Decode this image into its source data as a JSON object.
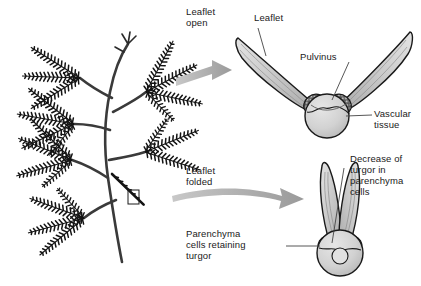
{
  "figure": {
    "background_color": "#ffffff",
    "width": 421,
    "height": 286
  },
  "palette": {
    "outline": "#1a1a1a",
    "leaflet_fill": "#c9c9c9",
    "leaflet_fill_light": "#dcdcdc",
    "pulvinus_fill": "#d2d2d2",
    "pulvinus_core_fill": "#e2e2e2",
    "parenchyma_dark": "#4a4a4a",
    "arrow_gray": "#a8a8a8",
    "plant_black": "#141414",
    "leader_line": "#444444",
    "text": "#1a1a1a"
  },
  "labels": {
    "leaflet_open": "Leaflet\nopen",
    "leaflet": "Leaflet",
    "pulvinus": "Pulvinus",
    "vascular_tissue": "Vascular\ntissue",
    "leaflet_folded": "Leaflet\nfolded",
    "decrease_turgor": "Decrease of\nturgor in\nparenchyma\ncells",
    "parenchyma_retaining": "Parenchyma\ncells retaining\nturgor"
  },
  "panels": {
    "plant": {
      "name": "mimosa-plant-illustration",
      "description": "Mimosa pudica branch with bipinnate compound leaves, upper leaves open and lower leaf marked by callout box",
      "callout_box": {
        "x": 128,
        "y": 190,
        "w": 11,
        "h": 14
      }
    },
    "open_cross_section": {
      "name": "leaflet-open-cross-section",
      "state": "open",
      "description": "Pair of leaflets spread wide in a V from a central pulvinus; parenchyma cells turgid"
    },
    "folded_cross_section": {
      "name": "leaflet-folded-cross-section",
      "state": "folded",
      "description": "Pair of leaflets raised nearly vertical and closed together; parenchyma cells lost turgor"
    }
  },
  "arrows": [
    {
      "name": "arrow-open",
      "from": "plant",
      "to": "open_cross_section",
      "label_key": "leaflet_open"
    },
    {
      "name": "arrow-folded",
      "from": "plant",
      "to": "folded_cross_section",
      "label_key": "leaflet_folded"
    }
  ]
}
